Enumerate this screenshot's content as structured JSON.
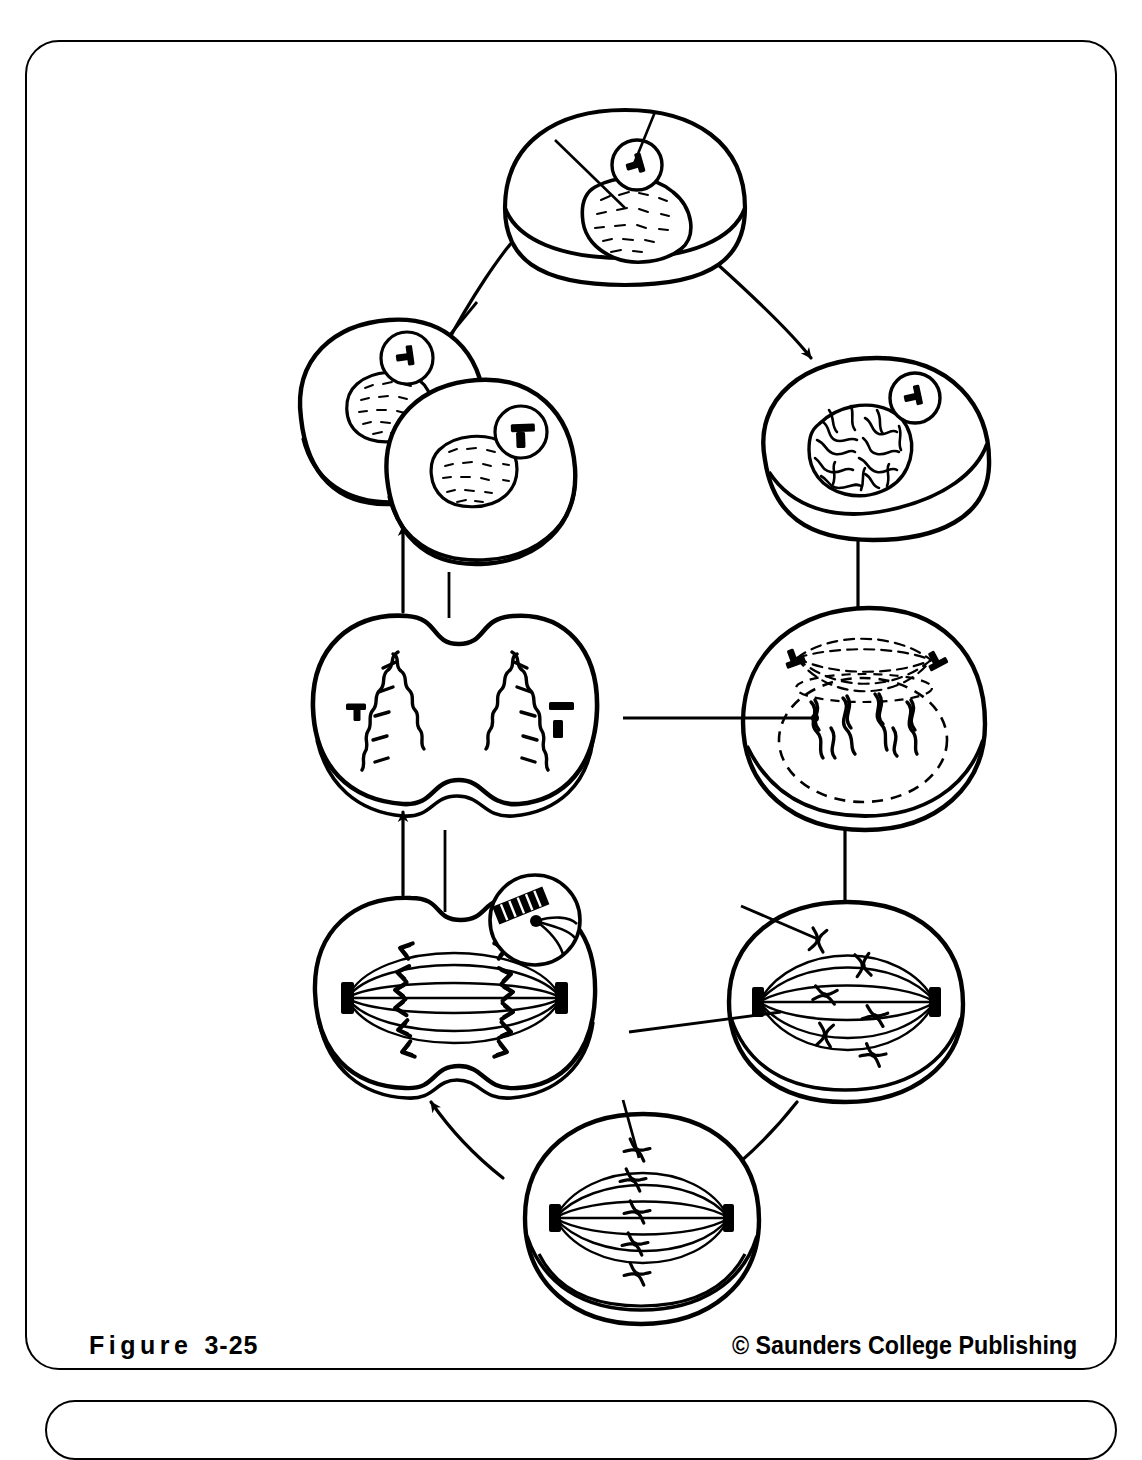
{
  "figure": {
    "label_word": "Figure",
    "label_number": "3-25",
    "copyright": "© Saunders College Publishing"
  },
  "diagram": {
    "type": "cycle-diagram",
    "stroke_color": "#000000",
    "background_color": "#ffffff",
    "direction": "clockwise",
    "stages": [
      {
        "id": "interphase",
        "name": "interphase-cell",
        "position": "top-center",
        "cx": 600,
        "cy": 175,
        "features": [
          "nucleus",
          "nucleolus",
          "centriole-pair",
          "leader-line-nucleus",
          "leader-line-centriole"
        ]
      },
      {
        "id": "early-prophase",
        "name": "early-prophase-cell",
        "position": "right-upper",
        "cx": 858,
        "cy": 415,
        "features": [
          "condensing-chromatin",
          "centriole-pair",
          "nuclear-envelope"
        ]
      },
      {
        "id": "late-prophase",
        "name": "late-prophase-cell",
        "position": "right-middle",
        "cx": 840,
        "cy": 685,
        "features": [
          "forming-spindle",
          "two-centriole-pairs",
          "dashed-nuclear-envelope",
          "chromosomes",
          "leader-line-chromosome"
        ]
      },
      {
        "id": "metaphase",
        "name": "metaphase-cell",
        "position": "right-lower",
        "cx": 820,
        "cy": 970,
        "features": [
          "spindle-fibers",
          "centrioles",
          "chromosomes-on-spindle",
          "leader-line-spindle-fiber",
          "leader-line-centromere"
        ]
      },
      {
        "id": "metaphase-plate",
        "name": "metaphase-plate-cell",
        "position": "bottom-center",
        "cx": 617,
        "cy": 1190,
        "features": [
          "chromosomes-aligned-at-equator",
          "spindle",
          "centrioles",
          "leader-line-equator"
        ]
      },
      {
        "id": "anaphase",
        "name": "anaphase-cell",
        "position": "left-lower",
        "cx": 410,
        "cy": 960,
        "features": [
          "separating-chromatids",
          "cleavage-furrow",
          "spindle",
          "kinetochore-inset-circle",
          "leader-line-top"
        ]
      },
      {
        "id": "telophase",
        "name": "telophase-cell",
        "position": "left-middle",
        "cx": 410,
        "cy": 678,
        "features": [
          "chromosome-clusters-at-poles",
          "deepening-cleavage-furrow",
          "two-centriole-pairs",
          "leader-line-top"
        ]
      },
      {
        "id": "daughter-cells",
        "name": "daughter-cells",
        "position": "left-upper",
        "cx": 410,
        "cy": 405,
        "features": [
          "two-cells",
          "two-nuclei",
          "two-centriole-pairs",
          "leader-line-top"
        ]
      }
    ],
    "arrows": [
      {
        "name": "arrow-interphase-to-early-prophase",
        "from": "interphase",
        "to": "early-prophase",
        "style": "curved"
      },
      {
        "name": "arrow-early-prophase-to-late-prophase",
        "from": "early-prophase",
        "to": "late-prophase",
        "style": "straight-down"
      },
      {
        "name": "arrow-late-prophase-to-metaphase",
        "from": "late-prophase",
        "to": "metaphase",
        "style": "straight-down"
      },
      {
        "name": "arrow-metaphase-to-metaphase-plate",
        "from": "metaphase",
        "to": "metaphase-plate",
        "style": "curved"
      },
      {
        "name": "arrow-metaphase-plate-to-anaphase",
        "from": "metaphase-plate",
        "to": "anaphase",
        "style": "curved"
      },
      {
        "name": "arrow-anaphase-to-telophase",
        "from": "anaphase",
        "to": "telophase",
        "style": "straight-up"
      },
      {
        "name": "arrow-telophase-to-daughter-cells",
        "from": "telophase",
        "to": "daughter-cells",
        "style": "straight-up"
      },
      {
        "name": "arrow-daughter-cells-to-interphase",
        "from": "daughter-cells",
        "to": "interphase",
        "style": "curved"
      }
    ]
  }
}
